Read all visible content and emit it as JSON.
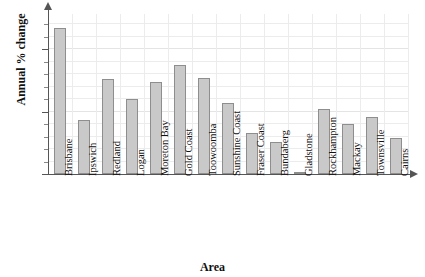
{
  "chart_data": {
    "type": "bar",
    "title": "",
    "xlabel": "Area",
    "ylabel": "Annual % change",
    "categories": [
      "Brisbane",
      "Ipswich",
      "Redland",
      "Logan",
      "Moreton Bay",
      "Gold Coast",
      "Toowoomba",
      "Sunshine Coast",
      "Fraser Coast",
      "Bundaberg",
      "Gladstone",
      "Rockhampton",
      "Mackay",
      "Townsville",
      "Cairns"
    ],
    "values": [
      11.7,
      4.3,
      7.6,
      6.0,
      7.4,
      8.7,
      7.7,
      5.7,
      3.3,
      2.6,
      0.1,
      5.2,
      4.0,
      4.6,
      2.9
    ],
    "ylim": [
      0,
      12.8
    ],
    "ytick_labels": [
      "0",
      "5",
      "10"
    ],
    "ytick_values": [
      0,
      5,
      10
    ],
    "yminor_step": 1,
    "grid": true,
    "legend": false,
    "bar_color": "#c9c9c9",
    "bar_border_color": "#8e8e8e",
    "axis_color": "#555555",
    "grid_color": "#ececec",
    "background": "#ffffff"
  }
}
